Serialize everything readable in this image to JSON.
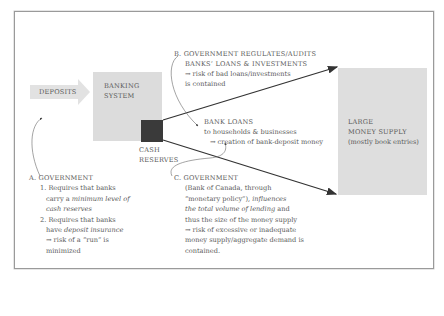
{
  "diagram": {
    "title_clipped": "",
    "nodes": {
      "deposits": {
        "label": "DEPOSITS"
      },
      "banking_system": {
        "line1": "BANKING",
        "line2": "SYSTEM"
      },
      "cash_reserves": {
        "line1": "CASH",
        "line2": "RESERVES"
      },
      "money_supply": {
        "line1": "LARGE",
        "line2": "MONEY SUPPLY",
        "line3": "(mostly book entries)"
      },
      "bank_loans": {
        "line1": "BANK LOANS",
        "line2": "to households & businesses",
        "line3": "→ creation of bank-deposit money"
      }
    },
    "annotations": {
      "a": {
        "heading": "A.  GOVERNMENT",
        "item1_l1": "1. Requires that banks",
        "item1_l2_pre": "carry a ",
        "item1_l2_em": "minimum level of",
        "item1_l3_em": "cash reserves",
        "item2_l1": "2. Requires that banks",
        "item2_l2_pre": "have ",
        "item2_l2_em": "deposit insurance",
        "item2_l3": "→ risk of a “run” is",
        "item2_l4": "minimized"
      },
      "b": {
        "line1": "B.  GOVERNMENT REGULATES/AUDITS",
        "line2": "BANKS’ LOANS & INVESTMENTS",
        "line3": "→ risk of bad loans/investments",
        "line4": "is contained"
      },
      "c": {
        "line1": "C.  GOVERNMENT",
        "line2": "(Bank of Canada, through",
        "line3_pre": "“monetary policy”), ",
        "line3_em": "influences",
        "line4_em": "the total volume of lending",
        "line4_post": " and",
        "line5": "thus the size of the money supply",
        "line6": "→ risk of excessive or inadequate",
        "line7": "money supply/aggregate demand is",
        "line8": "contained."
      }
    },
    "colors": {
      "box_fill": "#dcdcdc",
      "reserves_fill": "#3a3a3a",
      "arrow": "#333333",
      "text": "#5a5a5a",
      "border": "#9a9a9a"
    }
  }
}
